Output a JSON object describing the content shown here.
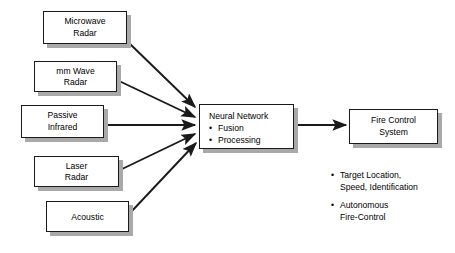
{
  "diagram": {
    "colors": {
      "box_fill": "#ffffff",
      "box_border": "#1a1a1a",
      "shadow": "#a9a9a9",
      "arrow": "#1a1a1a",
      "text": "#000000",
      "background": "#ffffff"
    },
    "sensors": [
      {
        "id": "microwave-radar",
        "line1": "Microwave",
        "line2": "Radar"
      },
      {
        "id": "mm-wave-radar",
        "line1": "mm Wave",
        "line2": "Radar"
      },
      {
        "id": "passive-infrared",
        "line1": "Passive",
        "line2": "Infrared"
      },
      {
        "id": "laser-radar",
        "line1": "Laser",
        "line2": "Radar"
      },
      {
        "id": "acoustic",
        "line1": "Acoustic",
        "line2": ""
      }
    ],
    "processor": {
      "id": "neural-network",
      "title": "Neural Network",
      "bullets": [
        "Fusion",
        "Processing"
      ]
    },
    "output": {
      "id": "fire-control-system",
      "line1": "Fire Control",
      "line2": "System"
    },
    "output_capabilities": [
      {
        "line1": "Target Location,",
        "line2": "Speed, Identification"
      },
      {
        "line1": "Autonomous",
        "line2": "Fire-Control"
      }
    ],
    "bullet_glyph": "•"
  }
}
